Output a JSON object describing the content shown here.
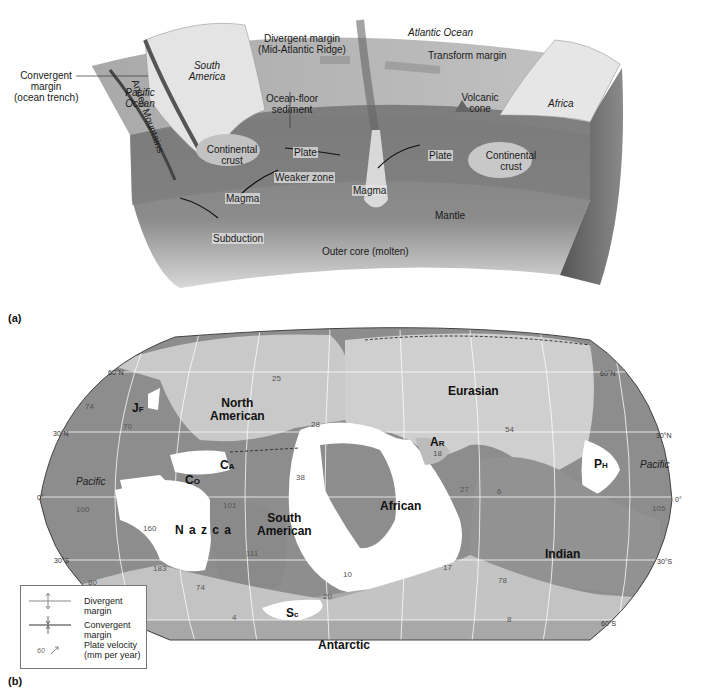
{
  "panel_a": {
    "tag": "(a)",
    "labels": {
      "convergent_margin": [
        "Convergent",
        "margin",
        "(ocean trench)"
      ],
      "pacific_ocean": [
        "Pacific",
        "Ocean"
      ],
      "andes": "Andes Mountains",
      "south_america": [
        "South",
        "America"
      ],
      "divergent_margin": [
        "Divergent margin",
        "(Mid-Atlantic Ridge)"
      ],
      "atlantic_ocean": "Atlantic Ocean",
      "transform_margin": "Transform margin",
      "ocean_floor_sediment": [
        "Ocean-floor",
        "sediment"
      ],
      "volcanic_cone": [
        "Volcanic",
        "cone"
      ],
      "africa": "Africa",
      "continental_crust_left": [
        "Continental",
        "crust"
      ],
      "continental_crust_right": [
        "Continental",
        "crust"
      ],
      "plate_left": "Plate",
      "plate_right": "Plate",
      "weaker_zone": "Weaker zone",
      "magma_left": "Magma",
      "magma_center": "Magma",
      "mantle": "Mantle",
      "subduction": "Subduction",
      "outer_core": "Outer core (molten)"
    }
  },
  "panel_b": {
    "tag": "(b)",
    "plates": {
      "north_american": [
        "North",
        "American"
      ],
      "eurasian": "Eurasian",
      "juan_de_fuca": {
        "big": "J",
        "small": "F"
      },
      "arabian": {
        "big": "A",
        "small": "R"
      },
      "philippine": {
        "big": "P",
        "small": "H"
      },
      "caribbean": {
        "big": "C",
        "small": "A"
      },
      "cocos": {
        "big": "C",
        "small": "O"
      },
      "nazca": "N a z c a",
      "south_american": [
        "South",
        "American"
      ],
      "african": "African",
      "indian": "Indian",
      "scotia": {
        "big": "S",
        "small": "c"
      },
      "antarctic": "Antarctic"
    },
    "oceans": {
      "pacific_west": "Pacific",
      "pacific_east": "Pacific"
    },
    "latitudes": {
      "w60n": "60°N",
      "w30n": "30°N",
      "w0": "0°",
      "w30s": "30°S",
      "e60n": "60°N",
      "e30n": "30°N",
      "e0": "0°",
      "e30s": "30°S",
      "e60s": "60°S"
    },
    "velocities": [
      "74",
      "70",
      "25",
      "28",
      "38",
      "101",
      "100",
      "160",
      "111",
      "183",
      "80",
      "74",
      "4",
      "20",
      "10",
      "18",
      "54",
      "27",
      "17",
      "105",
      "6",
      "8",
      "78"
    ],
    "legend": {
      "divergent": "Divergent margin",
      "convergent": "Convergent margin",
      "velocity_sample": "60",
      "velocity": [
        "Plate velocity",
        "(mm per year)"
      ]
    }
  },
  "colors": {
    "ocean_plate": "#8e8e8e",
    "land_light": "#c9c9c9",
    "land_dark": "#7d7d7d",
    "small_plate": "#ffffff",
    "mantle": "#8a8a8a",
    "crust_top": "#cfcfcf"
  }
}
